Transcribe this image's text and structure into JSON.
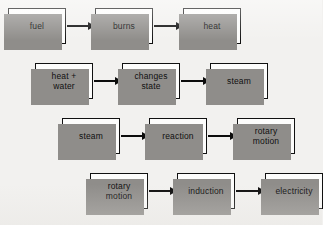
{
  "diagram": {
    "background_color": "#f2f1ef",
    "box_fill_color": "#fdfdfc",
    "box_border_color": "#111111",
    "shadow_color": "#8f8d8a",
    "arrow_color": "#0c0c0c",
    "rows": [
      {
        "name": "combustion-stage",
        "left": 8,
        "top": 8,
        "nodes": [
          {
            "label": "fuel",
            "x": 0
          },
          {
            "label": "burns",
            "x": 87
          },
          {
            "label": "heat",
            "x": 175
          }
        ],
        "arrows": [
          {
            "x": 59,
            "width": 27
          },
          {
            "x": 146,
            "width": 28
          }
        ]
      },
      {
        "name": "phase-change-stage",
        "left": 35,
        "top": 63,
        "nodes": [
          {
            "label": "heat +\nwater",
            "x": 0
          },
          {
            "label": "changes\nstate",
            "x": 87
          },
          {
            "label": "steam",
            "x": 175
          }
        ],
        "arrows": [
          {
            "x": 59,
            "width": 27
          },
          {
            "x": 146,
            "width": 28
          }
        ]
      },
      {
        "name": "turbine-stage",
        "left": 62,
        "top": 118,
        "nodes": [
          {
            "label": "steam",
            "x": 0
          },
          {
            "label": "reaction",
            "x": 87
          },
          {
            "label": "rotary\nmotion",
            "x": 175
          }
        ],
        "arrows": [
          {
            "x": 59,
            "width": 27
          },
          {
            "x": 146,
            "width": 28
          }
        ]
      },
      {
        "name": "generator-stage",
        "left": 90,
        "top": 173,
        "nodes": [
          {
            "label": "rotary\nmotion",
            "x": 0
          },
          {
            "label": "induction",
            "x": 87
          },
          {
            "label": "electricity",
            "x": 175
          }
        ],
        "arrows": [
          {
            "x": 59,
            "width": 27
          },
          {
            "x": 146,
            "width": 28
          }
        ]
      }
    ]
  }
}
